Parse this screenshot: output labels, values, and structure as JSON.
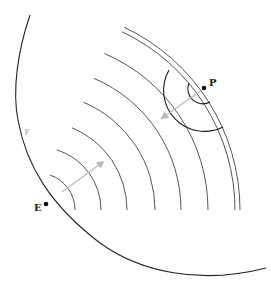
{
  "diagram": {
    "type": "wavefronts-between-points",
    "points": [
      {
        "id": "P",
        "label": "P",
        "x": 204,
        "y": 88
      },
      {
        "id": "E",
        "label": "E",
        "x": 46,
        "y": 204
      }
    ],
    "boundary_curve": {
      "label": "γ",
      "label_x": 24,
      "label_y": 133
    },
    "wavefronts": {
      "center_x": 38,
      "center_y": 210,
      "radii": [
        37,
        63,
        89,
        117,
        143,
        170,
        197,
        202
      ],
      "color": "#555555"
    },
    "local_arcs": {
      "center": "P",
      "radii": [
        14,
        41
      ],
      "color": "#1a1a1a"
    },
    "arrows": [
      {
        "from": [
          62,
          192
        ],
        "to": [
          103,
          162
        ],
        "color": "#bbbbbb",
        "direction": "outward"
      },
      {
        "from": [
          202,
          90
        ],
        "to": [
          162,
          118
        ],
        "color": "#bbbbbb",
        "direction": "inward"
      }
    ]
  }
}
